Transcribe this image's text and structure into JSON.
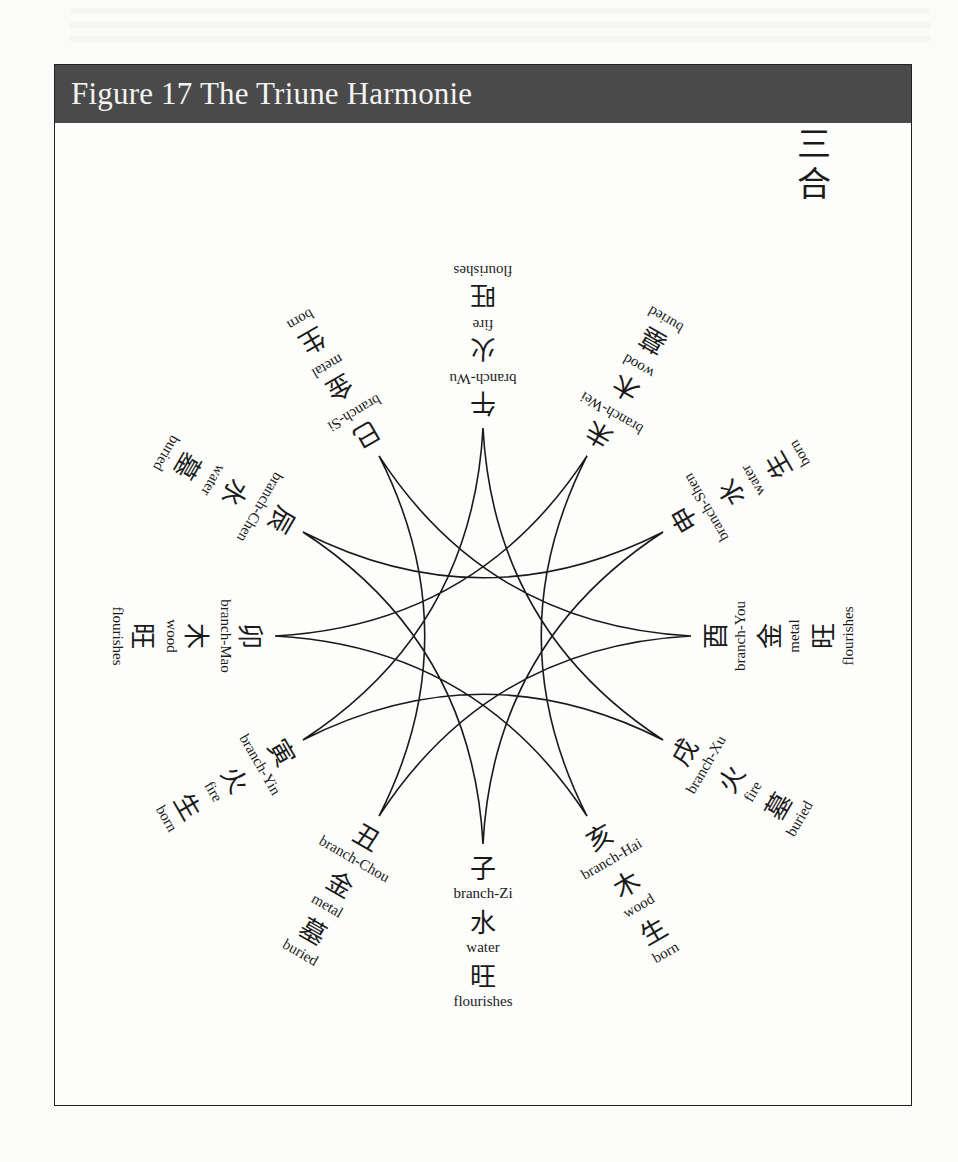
{
  "figure": {
    "title": "Figure 17 The Triune Harmonie",
    "corner_label": [
      "三",
      "合"
    ],
    "colors": {
      "header_bg": "#4a4a4a",
      "header_text": "#f4f4f4",
      "line": "#1a1a1a"
    }
  },
  "star": {
    "center": [
      483,
      636
    ],
    "radius": 208,
    "points": 12,
    "connection_step": 4,
    "description": "Four curvilinear triangles linking branches four apart"
  },
  "branches": [
    {
      "id": "zi",
      "angle": 0,
      "branch": "子",
      "branch_en": "branch-Zi",
      "element": "水",
      "element_en": "water",
      "phase": "旺",
      "phase_en": "flourishes"
    },
    {
      "id": "chou",
      "angle": 30,
      "branch": "丑",
      "branch_en": "branch-Chou",
      "element": "金",
      "element_en": "metal",
      "phase": "墓",
      "phase_en": "buried"
    },
    {
      "id": "yin",
      "angle": 60,
      "branch": "寅",
      "branch_en": "branch-Yin",
      "element": "火",
      "element_en": "fire",
      "phase": "生",
      "phase_en": "born"
    },
    {
      "id": "mao",
      "angle": 90,
      "branch": "卯",
      "branch_en": "branch-Mao",
      "element": "木",
      "element_en": "wood",
      "phase": "旺",
      "phase_en": "flourishes"
    },
    {
      "id": "chen",
      "angle": 120,
      "branch": "辰",
      "branch_en": "branch-Chen",
      "element": "水",
      "element_en": "water",
      "phase": "墓",
      "phase_en": "buried"
    },
    {
      "id": "si",
      "angle": 150,
      "branch": "巳",
      "branch_en": "branch-Si",
      "element": "金",
      "element_en": "metal",
      "phase": "生",
      "phase_en": "born"
    },
    {
      "id": "wu",
      "angle": 180,
      "branch": "午",
      "branch_en": "branch-Wu",
      "element": "火",
      "element_en": "fire",
      "phase": "旺",
      "phase_en": "flourishes"
    },
    {
      "id": "wei",
      "angle": 210,
      "branch": "未",
      "branch_en": "branch-Wei",
      "element": "木",
      "element_en": "wood",
      "phase": "墓",
      "phase_en": "buried"
    },
    {
      "id": "shen",
      "angle": 240,
      "branch": "申",
      "branch_en": "branch-Shen",
      "element": "水",
      "element_en": "water",
      "phase": "生",
      "phase_en": "born"
    },
    {
      "id": "you",
      "angle": 270,
      "branch": "酉",
      "branch_en": "branch-You",
      "element": "金",
      "element_en": "metal",
      "phase": "旺",
      "phase_en": "flourishes"
    },
    {
      "id": "xu",
      "angle": 300,
      "branch": "戌",
      "branch_en": "branch-Xu",
      "element": "火",
      "element_en": "fire",
      "phase": "墓",
      "phase_en": "buried"
    },
    {
      "id": "hai",
      "angle": 330,
      "branch": "亥",
      "branch_en": "branch-Hai",
      "element": "木",
      "element_en": "wood",
      "phase": "生",
      "phase_en": "born"
    }
  ]
}
